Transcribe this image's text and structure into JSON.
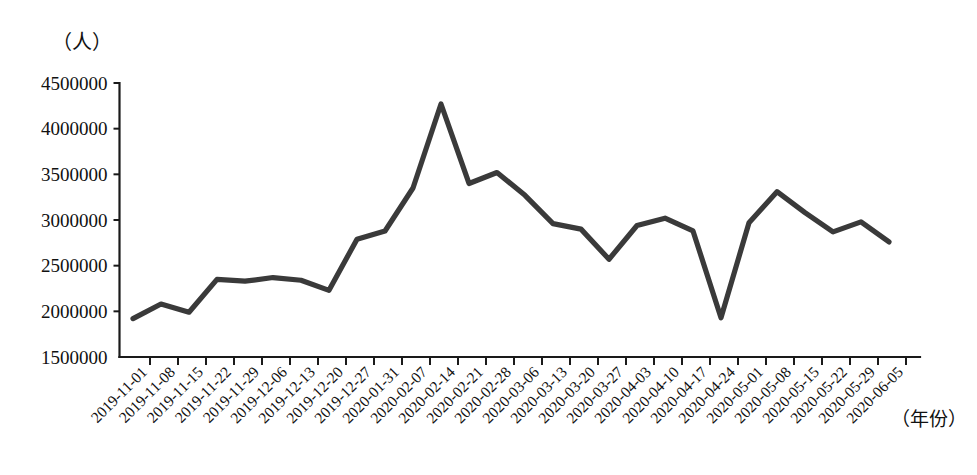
{
  "chart_data": {
    "type": "line",
    "title": "",
    "subtitle": "",
    "unit_label": "（人）",
    "xlabel": "（年份）",
    "ylabel": "",
    "grid": false,
    "legend": "none",
    "ylim": [
      1500000,
      4500000
    ],
    "ytick_labels": [
      "4500000",
      "4000000",
      "3500000",
      "3000000",
      "2500000",
      "2000000",
      "1500000"
    ],
    "ytick_values": [
      4500000,
      4000000,
      3500000,
      3000000,
      2500000,
      2000000,
      1500000
    ],
    "categories": [
      "2019-11-01",
      "2019-11-08",
      "2019-11-15",
      "2019-11-22",
      "2019-11-29",
      "2019-12-06",
      "2019-12-13",
      "2019-12-20",
      "2019-12-27",
      "2020-01-31",
      "2020-02-07",
      "2020-02-14",
      "2020-02-21",
      "2020-02-28",
      "2020-03-06",
      "2020-03-13",
      "2020-03-20",
      "2020-03-27",
      "2020-04-03",
      "2020-04-10",
      "2020-04-17",
      "2020-04-24",
      "2020-05-01",
      "2020-05-08",
      "2020-05-15",
      "2020-05-22",
      "2020-05-29",
      "2020-06-05"
    ],
    "series": [
      {
        "name": "人数",
        "color": "#3a3a3a",
        "values": [
          1920000,
          2080000,
          1990000,
          2350000,
          2330000,
          2370000,
          2340000,
          2230000,
          2790000,
          2880000,
          3350000,
          4270000,
          3400000,
          3520000,
          3270000,
          2960000,
          2900000,
          2570000,
          2940000,
          3020000,
          2880000,
          1930000,
          2970000,
          3310000,
          3080000,
          2870000,
          2980000,
          2760000
        ]
      }
    ]
  }
}
